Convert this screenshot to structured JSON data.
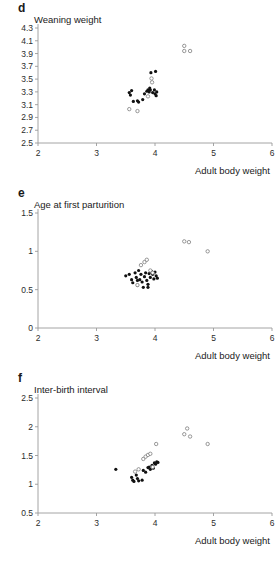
{
  "figure": {
    "panels": [
      {
        "letter": "d",
        "title": "Weaning weight",
        "xlabel": "Adult body weight"
      },
      {
        "letter": "e",
        "title": "Age at first parturition",
        "xlabel": "Adult body weight"
      },
      {
        "letter": "f",
        "title": "Inter-birth interval",
        "xlabel": "Adult body weight"
      }
    ]
  },
  "chart_data": [
    {
      "type": "scatter",
      "panel": "d",
      "title": "Weaning weight",
      "xlabel": "Adult body weight",
      "ylabel": "Weaning weight",
      "xlim": [
        2,
        6
      ],
      "ylim": [
        2.5,
        4.3
      ],
      "xticks": [
        2,
        3,
        4,
        5,
        6
      ],
      "xticklabels": [
        "2",
        "3",
        "4",
        "5",
        "6"
      ],
      "yticks": [
        2.5,
        2.7,
        2.9,
        3.1,
        3.3,
        3.5,
        3.7,
        3.9,
        4.1,
        4.3
      ],
      "yticklabels": [
        "2.5",
        "2.7",
        "2.9",
        "3.1",
        "3.3",
        "3.5",
        "3.7",
        "3.9",
        "4.1",
        "4.3"
      ],
      "grid": false,
      "legend": false,
      "series": [
        {
          "name": "filled",
          "marker": "filled-circle",
          "points": [
            [
              3.56,
              3.29
            ],
            [
              3.58,
              3.25
            ],
            [
              3.6,
              3.32
            ],
            [
              3.63,
              3.15
            ],
            [
              3.7,
              3.16
            ],
            [
              3.72,
              3.14
            ],
            [
              3.79,
              3.18
            ],
            [
              3.82,
              3.27
            ],
            [
              3.86,
              3.31
            ],
            [
              3.88,
              3.33
            ],
            [
              3.9,
              3.3
            ],
            [
              3.91,
              3.36
            ],
            [
              3.92,
              3.33
            ],
            [
              3.93,
              3.6
            ],
            [
              3.96,
              3.29
            ],
            [
              3.99,
              3.33
            ],
            [
              4.0,
              3.27
            ],
            [
              4.01,
              3.62
            ],
            [
              4.02,
              3.24
            ],
            [
              4.03,
              3.3
            ]
          ]
        },
        {
          "name": "open",
          "marker": "open-circle",
          "points": [
            [
              3.56,
              3.03
            ],
            [
              3.7,
              3.0
            ],
            [
              3.88,
              3.23
            ],
            [
              3.95,
              3.45
            ],
            [
              3.94,
              3.51
            ],
            [
              4.5,
              4.02
            ],
            [
              4.5,
              3.94
            ],
            [
              4.6,
              3.94
            ]
          ]
        }
      ]
    },
    {
      "type": "scatter",
      "panel": "e",
      "title": "Age at first parturition",
      "xlabel": "Adult body weight",
      "ylabel": "Age at first parturition",
      "xlim": [
        2,
        6
      ],
      "ylim": [
        0,
        1.5
      ],
      "xticks": [
        2,
        3,
        4,
        5,
        6
      ],
      "xticklabels": [
        "2",
        "3",
        "4",
        "5",
        "6"
      ],
      "yticks": [
        0,
        0.5,
        1,
        1.5
      ],
      "yticklabels": [
        "0",
        "0.5",
        "1",
        "1.5"
      ],
      "grid": false,
      "legend": false,
      "series": [
        {
          "name": "filled",
          "marker": "filled-circle",
          "points": [
            [
              3.5,
              0.68
            ],
            [
              3.56,
              0.7
            ],
            [
              3.6,
              0.63
            ],
            [
              3.62,
              0.59
            ],
            [
              3.66,
              0.72
            ],
            [
              3.68,
              0.66
            ],
            [
              3.7,
              0.56
            ],
            [
              3.72,
              0.75
            ],
            [
              3.74,
              0.63
            ],
            [
              3.76,
              0.7
            ],
            [
              3.78,
              0.6
            ],
            [
              3.8,
              0.53
            ],
            [
              3.82,
              0.67
            ],
            [
              3.84,
              0.72
            ],
            [
              3.86,
              0.62
            ],
            [
              3.88,
              0.57
            ],
            [
              3.9,
              0.71
            ],
            [
              3.92,
              0.66
            ],
            [
              3.94,
              0.74
            ],
            [
              3.96,
              0.7
            ],
            [
              3.98,
              0.64
            ],
            [
              4.0,
              0.73
            ],
            [
              4.02,
              0.68
            ],
            [
              4.04,
              0.65
            ],
            [
              3.88,
              0.53
            ],
            [
              3.7,
              0.62
            ]
          ]
        },
        {
          "name": "open",
          "marker": "open-circle",
          "points": [
            [
              3.7,
              0.56
            ],
            [
              3.76,
              0.82
            ],
            [
              3.82,
              0.86
            ],
            [
              3.86,
              0.89
            ],
            [
              3.92,
              0.75
            ],
            [
              3.96,
              0.72
            ],
            [
              4.5,
              1.13
            ],
            [
              4.58,
              1.12
            ],
            [
              4.9,
              1.0
            ]
          ]
        }
      ]
    },
    {
      "type": "scatter",
      "panel": "f",
      "title": "Inter-birth interval",
      "xlabel": "Adult body weight",
      "ylabel": "Inter-birth interval",
      "xlim": [
        2,
        6
      ],
      "ylim": [
        0.5,
        2.5
      ],
      "xticks": [
        2,
        3,
        4,
        5,
        6
      ],
      "xticklabels": [
        "2",
        "3",
        "4",
        "5",
        "6"
      ],
      "yticks": [
        0.5,
        1,
        1.5,
        2,
        2.5
      ],
      "yticklabels": [
        "0.5",
        "1",
        "1.5",
        "2",
        "2.5"
      ],
      "grid": false,
      "legend": false,
      "series": [
        {
          "name": "filled",
          "marker": "filled-circle",
          "points": [
            [
              3.33,
              1.26
            ],
            [
              3.6,
              1.12
            ],
            [
              3.62,
              1.07
            ],
            [
              3.64,
              1.05
            ],
            [
              3.68,
              1.16
            ],
            [
              3.7,
              1.1
            ],
            [
              3.72,
              1.06
            ],
            [
              3.78,
              1.07
            ],
            [
              3.8,
              1.24
            ],
            [
              3.84,
              1.21
            ],
            [
              3.88,
              1.29
            ],
            [
              3.9,
              1.3
            ],
            [
              3.92,
              1.26
            ],
            [
              3.95,
              1.33
            ],
            [
              3.97,
              1.28
            ],
            [
              3.99,
              1.37
            ],
            [
              4.01,
              1.35
            ],
            [
              4.03,
              1.39
            ],
            [
              4.05,
              1.38
            ]
          ]
        },
        {
          "name": "open",
          "marker": "open-circle",
          "points": [
            [
              3.66,
              1.22
            ],
            [
              3.72,
              1.26
            ],
            [
              3.8,
              1.44
            ],
            [
              3.84,
              1.48
            ],
            [
              3.88,
              1.51
            ],
            [
              3.92,
              1.53
            ],
            [
              3.96,
              1.3
            ],
            [
              4.02,
              1.7
            ],
            [
              4.5,
              1.87
            ],
            [
              4.55,
              1.97
            ],
            [
              4.6,
              1.83
            ],
            [
              4.9,
              1.7
            ]
          ]
        }
      ]
    }
  ]
}
